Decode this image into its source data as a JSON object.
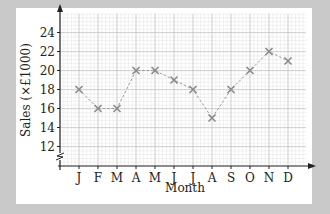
{
  "chart_data": {
    "type": "line",
    "title": "",
    "xlabel": "Month",
    "ylabel": "Sales (×£1000)",
    "categories": [
      "J",
      "F",
      "M",
      "A",
      "M",
      "J",
      "J",
      "A",
      "S",
      "O",
      "N",
      "D"
    ],
    "series": [
      {
        "name": "Sales",
        "values": [
          18,
          16,
          16,
          20,
          20,
          19,
          18,
          15,
          18,
          20,
          22,
          21
        ]
      }
    ],
    "yticks": [
      12,
      14,
      16,
      18,
      20,
      22,
      24
    ],
    "ylim": [
      11,
      25
    ],
    "y_axis_break": true,
    "grid": true,
    "marker": "x",
    "line_style": "dashed",
    "legend": "none"
  },
  "colors": {
    "background": "#c9c9c9",
    "panel": "#ffffff",
    "grid_major": "#bdbdbd",
    "grid_minor": "#e2e2e2",
    "line": "#9a9a9a",
    "marker": "#8a8a8a",
    "axis": "#222222"
  }
}
